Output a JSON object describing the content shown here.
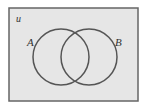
{
  "diagram": {
    "type": "venn",
    "universe_label": "u",
    "sets": [
      {
        "label": "A"
      },
      {
        "label": "B"
      }
    ],
    "colors": {
      "background": "#ffffff",
      "universe_fill": "#e6e6e6",
      "universe_border": "#555555",
      "circle_stroke": "#555555",
      "label": "#333333"
    }
  }
}
